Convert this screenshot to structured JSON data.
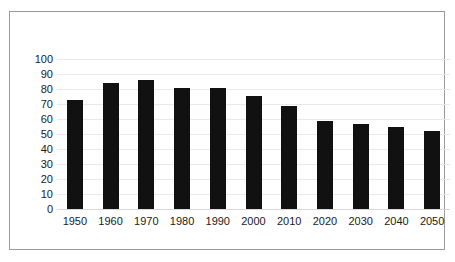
{
  "chart_data": {
    "type": "bar",
    "title": "",
    "subtitle": "",
    "xlabel": "",
    "ylabel": "",
    "categories": [
      "1950",
      "1960",
      "1970",
      "1980",
      "1990",
      "2000",
      "2010",
      "2020",
      "2030",
      "2040",
      "2050"
    ],
    "values": [
      73,
      84,
      86,
      81,
      80.5,
      75.5,
      68.5,
      59,
      57,
      55,
      52
    ],
    "series": [
      {
        "name": "",
        "values": [
          73,
          84,
          86,
          81,
          80.5,
          75.5,
          68.5,
          59,
          57,
          55,
          52
        ]
      }
    ],
    "ylim": [
      0,
      100
    ],
    "yticks": [
      0,
      10,
      20,
      30,
      40,
      50,
      60,
      70,
      80,
      90,
      100
    ],
    "ytick_labels": [
      "0",
      "10",
      "20",
      "30",
      "40",
      "50",
      "60",
      "70",
      "80",
      "90",
      "100"
    ],
    "grid": true,
    "grid_axis": "y",
    "legend": false,
    "legend_position": "none",
    "bar_color": "#111111",
    "grid_color": "#e9e9e9",
    "frame_color": "#9a9a9a",
    "background_color": "#ffffff",
    "annotations": []
  }
}
